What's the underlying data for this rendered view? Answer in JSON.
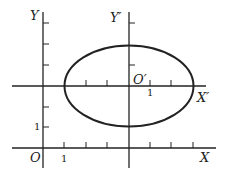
{
  "figure": {
    "type": "coordinate-translation-diagram",
    "original_axes": {
      "x_label": "X",
      "y_label": "Y",
      "origin_label": "O",
      "x_unit_label": "1",
      "y_unit_label": "1"
    },
    "translated_axes": {
      "x_label": "X′",
      "y_label": "Y′",
      "origin_label": "O′",
      "x_unit_label": "1"
    },
    "ellipse": {
      "center_original": [
        4,
        3
      ],
      "semi_axis_x": 3,
      "semi_axis_y": 2
    },
    "colors": {
      "stroke": "#222222",
      "background": "#ffffff"
    }
  }
}
